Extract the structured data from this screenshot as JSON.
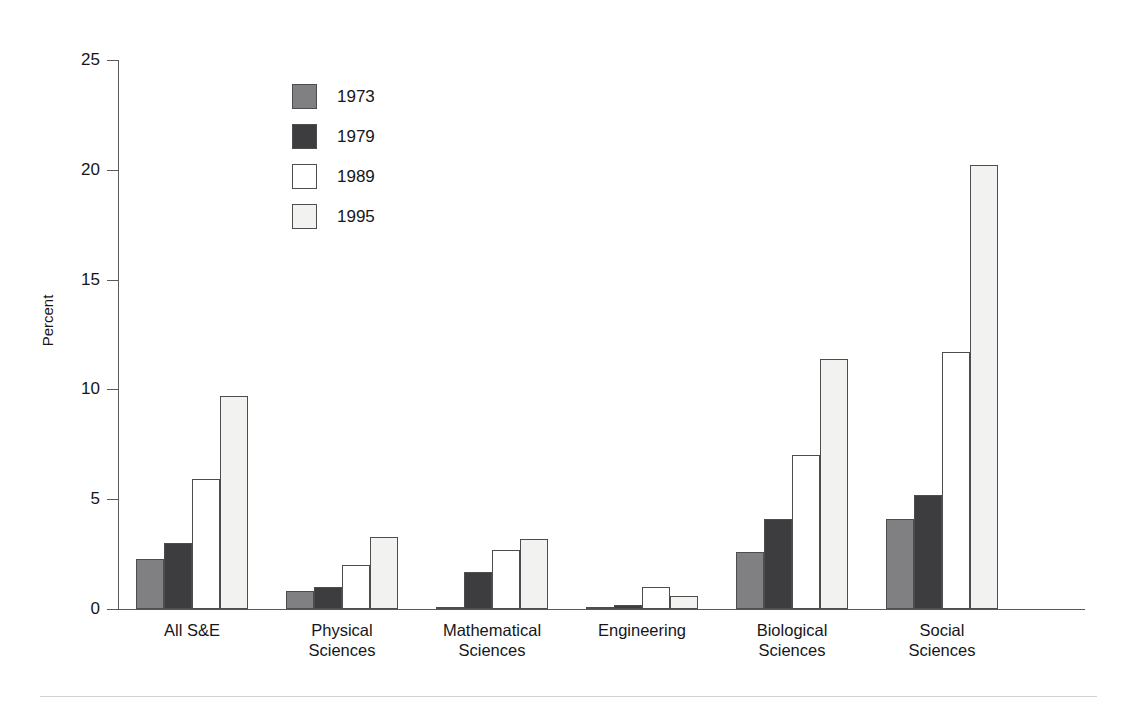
{
  "chart_data": {
    "type": "bar",
    "title": "",
    "xlabel": "",
    "ylabel": "Percent",
    "ylim": [
      0,
      25
    ],
    "yticks": [
      0,
      5,
      10,
      15,
      20,
      25
    ],
    "grid": false,
    "legend_position": "upper-left-inside",
    "categories": [
      "All S&E",
      "Physical\nSciences",
      "Mathematical\nSciences",
      "Engineering",
      "Biological\nSciences",
      "Social\nSciences"
    ],
    "series": [
      {
        "name": "1973",
        "color": "#808083",
        "values": [
          2.3,
          0.8,
          0.1,
          0.1,
          2.6,
          4.1
        ]
      },
      {
        "name": "1979",
        "color": "#3d3d40",
        "values": [
          3.0,
          1.0,
          1.7,
          0.2,
          4.1,
          5.2
        ]
      },
      {
        "name": "1989",
        "color": "#ffffff",
        "values": [
          5.9,
          2.0,
          2.7,
          1.0,
          7.0,
          11.7
        ]
      },
      {
        "name": "1995",
        "color": "#f2f2f0",
        "values": [
          9.7,
          3.3,
          3.2,
          0.6,
          11.4,
          20.2
        ]
      }
    ]
  },
  "axis": {
    "tick_labels": [
      "0",
      "5",
      "10",
      "15",
      "20",
      "25"
    ],
    "y_title": "Percent"
  },
  "legend": {
    "items": [
      {
        "label": "1973"
      },
      {
        "label": "1979"
      },
      {
        "label": "1989"
      },
      {
        "label": "1995"
      }
    ]
  },
  "colors": {
    "axis": "#59595c",
    "bar_outline": "#4d4d4f",
    "text": "#16161a",
    "footer_rule": "#d2d2d4",
    "background": "#ffffff"
  }
}
